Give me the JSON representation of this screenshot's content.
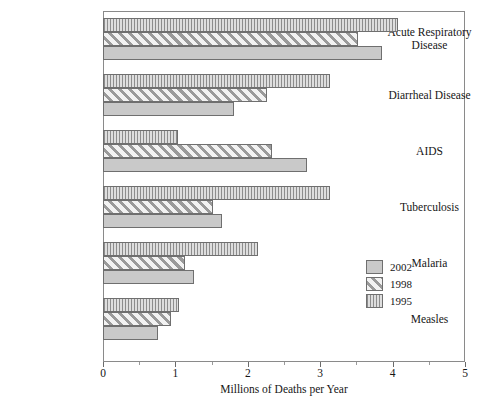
{
  "chart_data": {
    "type": "bar",
    "orientation": "horizontal",
    "title": "",
    "xlabel": "Millions of Deaths per Year",
    "ylabel": "",
    "xlim": [
      0,
      5
    ],
    "grid": false,
    "legend_position": "right-inside",
    "xticks": [
      "0",
      "1",
      "2",
      "3",
      "4",
      "5"
    ],
    "xtick_values": [
      0,
      1,
      2,
      3,
      4,
      5
    ],
    "xminor_values": [
      0.5,
      1.5,
      2.5,
      3.5,
      4.5
    ],
    "categories": [
      "Acute Respiratory Disease",
      "Diarrheal Disease",
      "AIDS",
      "Tuberculosis",
      "Malaria",
      "Measles"
    ],
    "series": [
      {
        "name": "2002",
        "pattern": "solid-gray",
        "color": "#c9c9c9",
        "values": [
          3.85,
          1.81,
          2.82,
          1.64,
          1.26,
          0.76
        ]
      },
      {
        "name": "1998",
        "pattern": "diagonal-hatch",
        "color": "#f2f2f2",
        "values": [
          3.52,
          2.27,
          2.33,
          1.52,
          1.13,
          0.94
        ]
      },
      {
        "name": "1995",
        "pattern": "vertical-hatch",
        "color": "#8d8d8d",
        "values": [
          4.07,
          3.14,
          1.04,
          3.14,
          2.14,
          1.05
        ]
      }
    ]
  },
  "legend": {
    "items": [
      {
        "label": "2002",
        "pattern": "solid-gray"
      },
      {
        "label": "1998",
        "pattern": "diagonal-hatch"
      },
      {
        "label": "1995",
        "pattern": "vertical-hatch"
      }
    ]
  }
}
